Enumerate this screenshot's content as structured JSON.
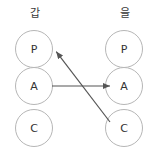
{
  "diagram": {
    "canvas": {
      "width": 159,
      "height": 158,
      "background": "#ffffff"
    },
    "colors": {
      "circle_stroke": "#b6b6b6",
      "circle_fill": "#ffffff",
      "node_text": "#333333",
      "label_text": "#3a3a3a",
      "arrow_stroke": "#555555"
    },
    "columns": [
      {
        "id": "left",
        "label": "갑",
        "label_x": 15,
        "label_y": 8,
        "cx": 34,
        "nodes": [
          {
            "id": "left-p",
            "text": "P",
            "x": 15,
            "y": 30
          },
          {
            "id": "left-a",
            "text": "A",
            "x": 15,
            "y": 67
          },
          {
            "id": "left-c",
            "text": "C",
            "x": 15,
            "y": 109
          }
        ]
      },
      {
        "id": "right",
        "label": "을",
        "label_x": 105,
        "label_y": 8,
        "cx": 124,
        "nodes": [
          {
            "id": "right-p",
            "text": "P",
            "x": 105,
            "y": 30
          },
          {
            "id": "right-a",
            "text": "A",
            "x": 105,
            "y": 67
          },
          {
            "id": "right-c",
            "text": "C",
            "x": 105,
            "y": 109
          }
        ]
      }
    ],
    "arrows": [
      {
        "id": "arrow-left-a-to-right-a",
        "from": "left-a",
        "to": "right-a",
        "x1": 52,
        "y1": 86,
        "x2": 112,
        "y2": 86,
        "direction": "horizontal-rightward"
      },
      {
        "id": "arrow-right-c-to-left-p",
        "from": "right-c",
        "to": "left-p",
        "x1": 110,
        "y1": 122,
        "x2": 55,
        "y2": 50,
        "direction": "diagonal-upleft"
      }
    ]
  }
}
